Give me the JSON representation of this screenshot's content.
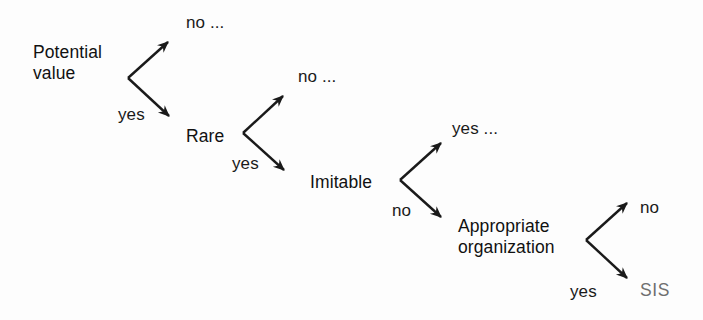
{
  "diagram": {
    "type": "decision-tree",
    "background_color": "#fdfdfd",
    "ink_color": "#1a1a1a",
    "muted_color": "#6f6f6f",
    "nodes": [
      {
        "id": "potential-value",
        "label_lines": [
          "Potential",
          "value"
        ],
        "x": 33,
        "y": 42,
        "branch_up_label": "no ...",
        "branch_down_label": "yes"
      },
      {
        "id": "rare",
        "label_lines": [
          "Rare"
        ],
        "x": 186,
        "y": 127,
        "branch_up_label": "no ...",
        "branch_down_label": "yes"
      },
      {
        "id": "imitable",
        "label_lines": [
          "Imitable"
        ],
        "x": 310,
        "y": 173,
        "branch_up_label": "yes ...",
        "branch_down_label": "no"
      },
      {
        "id": "appropriate-organization",
        "label_lines": [
          "Appropriate",
          "organization"
        ],
        "x": 458,
        "y": 217,
        "branch_up_label": "no",
        "branch_down_label": "yes"
      }
    ],
    "branch_labels": {
      "potential_value_up": "no ...",
      "potential_value_down": "yes",
      "rare_up": "no ...",
      "rare_down": "yes",
      "imitable_up": "yes ...",
      "imitable_down": "no",
      "organization_up": "no",
      "organization_down": "yes"
    },
    "node_labels": {
      "potential_value_line1": "Potential",
      "potential_value_line2": "value",
      "rare": "Rare",
      "imitable": "Imitable",
      "organization_line1": "Appropriate",
      "organization_line2": "organization"
    },
    "terminal": {
      "label": "SIS",
      "color": "#6f6f6f"
    }
  }
}
